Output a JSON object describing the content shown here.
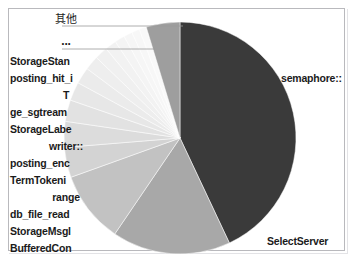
{
  "chart_data": {
    "type": "pie",
    "title": "",
    "legend_position": "callout-labels",
    "grid": false,
    "center": {
      "x": 180,
      "y": 138
    },
    "radius": 116,
    "start_angle_deg": -90,
    "direction": "clockwise",
    "labels": [
      "semaphore::",
      "SelectServer",
      "BufferedCon",
      "StorageMsgl",
      "db_file_read",
      "range",
      "TermTokeni",
      "posting_enc",
      "writer::",
      "StorageLabe",
      "ge_sgtream",
      "T",
      "posting_hit_i",
      "StorageStan",
      "...",
      "其他"
    ],
    "values": [
      43.0,
      16.5,
      10.0,
      4.2,
      3.6,
      3.0,
      2.6,
      2.3,
      2.0,
      1.8,
      1.6,
      1.4,
      1.2,
      1.1,
      1.0,
      4.7
    ],
    "colors": [
      "#3a3a3a",
      "#a8a8a8",
      "#c2c2c2",
      "#d3d3d3",
      "#dcdcdc",
      "#e2e2e2",
      "#e7e7e7",
      "#ebebeb",
      "#eeeeee",
      "#f0f0f0",
      "#f2f2f2",
      "#f4f4f4",
      "#f6f6f6",
      "#f7f7f7",
      "#f9f9f9",
      "#9e9e9e"
    ],
    "xlabel": "",
    "ylabel": ""
  },
  "labels": {
    "semaphore": "semaphore::",
    "select_server": "SelectServer",
    "buffered_con": "BufferedCon",
    "storage_msgl": "StorageMsgl",
    "db_file_read": "db_file_read",
    "range": "range",
    "term_tokeni": "TermTokeni",
    "posting_enc": "posting_enc",
    "writer": "writer::",
    "storage_labe": "StorageLabe",
    "ge_sgtream": "ge_sgtream",
    "t": "T",
    "posting_hit_i": "posting_hit_i",
    "storage_stan": "StorageStan",
    "ellipsis": "...",
    "other": "其他"
  }
}
